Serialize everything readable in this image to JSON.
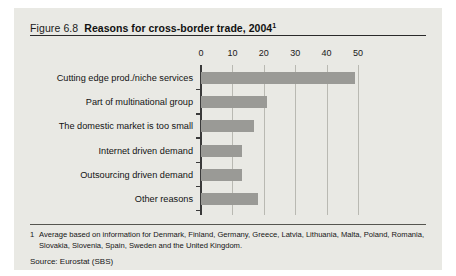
{
  "figure": {
    "number_label": "Figure 6.8",
    "title": "Reasons for cross-border trade, 2004",
    "title_superscript": "1"
  },
  "footnote": {
    "marker": "1",
    "text": "Average based on information for Denmark, Finland, Germany, Greece, Latvia, Lithuania, Malta, Poland, Romania, Slovakia, Slovenia, Spain, Sweden and the United Kingdom."
  },
  "source": {
    "text": "Source: Eurostat (SBS)"
  },
  "chart_data": {
    "type": "bar",
    "orientation": "horizontal",
    "title": "Reasons for cross-border trade, 2004",
    "xlabel": "",
    "ylabel": "",
    "xlim": [
      0,
      55
    ],
    "xticks": [
      0,
      10,
      20,
      30,
      40,
      50
    ],
    "xtick_labels": [
      "0",
      "10",
      "20",
      "30",
      "40",
      "50"
    ],
    "grid": "vertical",
    "legend": "none",
    "bar_color": "#9a9a96",
    "categories": [
      "Cutting edge prod./niche services",
      "Part of multinational group",
      "The domestic market is too small",
      "Internet driven demand",
      "Outsourcing driven demand",
      "Other reasons"
    ],
    "values": [
      49,
      21,
      17,
      13,
      13,
      18
    ]
  }
}
